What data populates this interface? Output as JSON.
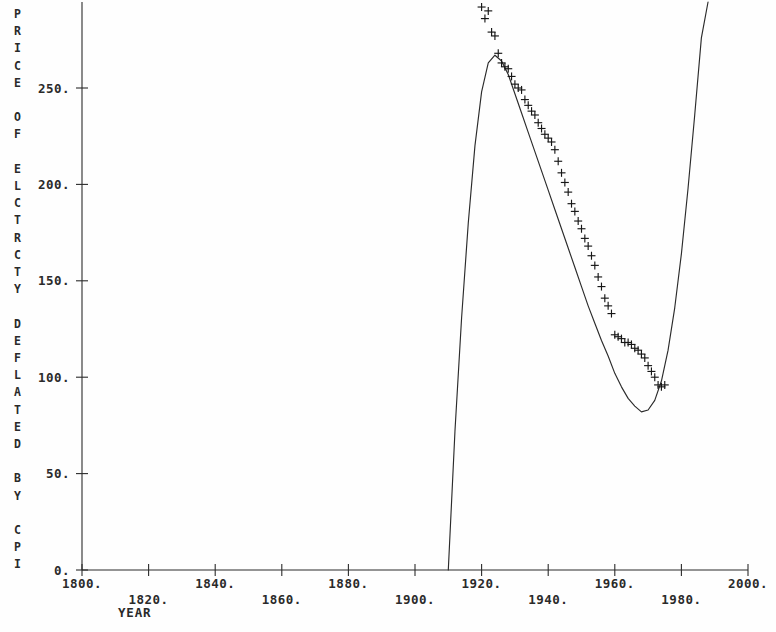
{
  "chart_data": {
    "type": "scatter",
    "title": "",
    "subtitle": "",
    "xlabel": "YEAR",
    "ylabel": "PRICE OF ELCTRCTY DEFLATED BY CPI",
    "ylabel_chars": [
      "P",
      "R",
      "I",
      "C",
      "E",
      "",
      "O",
      "F",
      "",
      "E",
      "L",
      "C",
      "T",
      "R",
      "C",
      "T",
      "Y",
      "",
      "D",
      "E",
      "F",
      "L",
      "A",
      "T",
      "E",
      "D",
      "",
      "B",
      "Y",
      "",
      "C",
      "P",
      "I"
    ],
    "xlim": [
      1800,
      2000
    ],
    "ylim": [
      0,
      290
    ],
    "grid": false,
    "legend": "none",
    "xticks": [
      1800,
      1820,
      1840,
      1860,
      1880,
      1900,
      1920,
      1940,
      1960,
      1980,
      2000
    ],
    "xticklabels": [
      "1800.",
      "1820.",
      "1840.",
      "1860.",
      "1880.",
      "1900.",
      "1920.",
      "1940.",
      "1960.",
      "1980.",
      "2000."
    ],
    "xtick_rows": [
      0,
      1,
      0,
      1,
      0,
      1,
      0,
      1,
      0,
      1,
      0
    ],
    "yticks": [
      0,
      50,
      100,
      150,
      200,
      250
    ],
    "yticklabels": [
      "0.",
      "50.",
      "100.",
      "150.",
      "200.",
      "250."
    ],
    "marker_symbol": "+",
    "marker_color": "#171717",
    "curve_color": "#2b2b2b",
    "axis_color": "#2b2b2b",
    "background_color": "#fefefe",
    "series": [
      {
        "name": "Observed price of electricity deflated by CPI",
        "marker": "+",
        "x": [
          1920,
          1921,
          1922,
          1923,
          1924,
          1925,
          1926,
          1927,
          1928,
          1929,
          1930,
          1931,
          1932,
          1933,
          1934,
          1935,
          1936,
          1937,
          1938,
          1939,
          1940,
          1941,
          1942,
          1943,
          1944,
          1945,
          1946,
          1947,
          1948,
          1949,
          1950,
          1951,
          1952,
          1953,
          1954,
          1955,
          1956,
          1957,
          1958,
          1959,
          1960,
          1961,
          1962,
          1963,
          1964,
          1965,
          1966,
          1967,
          1968,
          1969,
          1970,
          1971,
          1972,
          1973,
          1974,
          1975
        ],
        "y": [
          292,
          286,
          290,
          279,
          277,
          268,
          263,
          261,
          260,
          256,
          252,
          250,
          249,
          244,
          241,
          238,
          236,
          232,
          229,
          226,
          224,
          222,
          218,
          212,
          206,
          201,
          196,
          190,
          186,
          181,
          177,
          172,
          168,
          163,
          158,
          152,
          147,
          141,
          137,
          133,
          122,
          121,
          120,
          118,
          118,
          117,
          115,
          114,
          112,
          110,
          106,
          103,
          100,
          96,
          95,
          96
        ]
      }
    ],
    "fitted_curve": {
      "name": "Fitted polynomial trend",
      "degree": 3,
      "x_range": [
        1910,
        1988
      ],
      "x_axis_crossing": 1910,
      "peak": {
        "x": 1924,
        "y": 267
      },
      "minimum": {
        "x": 1968,
        "y": 82
      },
      "x": [
        1910,
        1912,
        1914,
        1916,
        1918,
        1920,
        1922,
        1924,
        1926,
        1928,
        1930,
        1932,
        1934,
        1936,
        1938,
        1940,
        1942,
        1944,
        1946,
        1948,
        1950,
        1952,
        1954,
        1956,
        1958,
        1960,
        1962,
        1964,
        1966,
        1968,
        1970,
        1972,
        1974,
        1976,
        1978,
        1980,
        1982,
        1984,
        1986,
        1988
      ],
      "y": [
        0,
        72,
        131,
        180,
        220,
        248,
        263,
        267,
        264,
        257,
        247,
        237,
        227,
        217,
        207,
        197,
        187,
        177,
        167,
        157,
        147,
        137,
        128,
        119,
        111,
        102,
        95,
        89,
        85,
        82,
        83,
        88,
        98,
        114,
        136,
        164,
        198,
        236,
        276,
        300
      ]
    }
  }
}
